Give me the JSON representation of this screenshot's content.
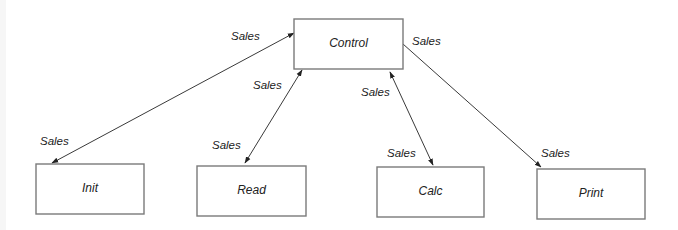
{
  "diagram": {
    "type": "module-structure",
    "nodes": [
      {
        "id": "control",
        "label": "Control"
      },
      {
        "id": "init",
        "label": "Init"
      },
      {
        "id": "read",
        "label": "Read"
      },
      {
        "id": "calc",
        "label": "Calc"
      },
      {
        "id": "print",
        "label": "Print"
      }
    ],
    "edges": [
      {
        "from": "control",
        "to": "init",
        "direction": "both",
        "labels": [
          "Sales",
          "Sales"
        ]
      },
      {
        "from": "control",
        "to": "read",
        "direction": "both",
        "labels": [
          "Sales",
          "Sales"
        ]
      },
      {
        "from": "control",
        "to": "calc",
        "direction": "both",
        "labels": [
          "Sales",
          "Sales"
        ]
      },
      {
        "from": "control",
        "to": "print",
        "direction": "forward",
        "labels": [
          "Sales",
          "Sales"
        ]
      }
    ]
  }
}
